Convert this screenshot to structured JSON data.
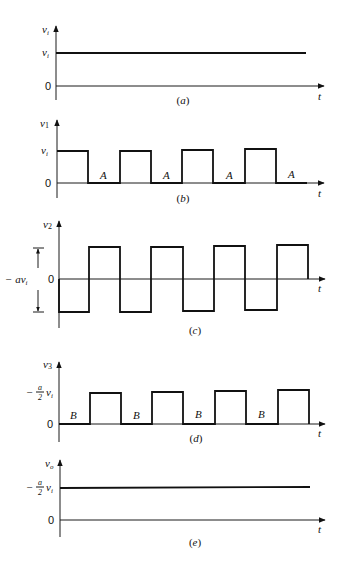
{
  "figure": {
    "panels": [
      {
        "id": "a",
        "caption": "(a)",
        "caption_letter": "a",
        "y_axis_label": "v",
        "y_axis_sub": "i",
        "x_axis_label": "t",
        "level_label_main": "v",
        "level_label_sub": "i",
        "zero_label": "0",
        "waveform": "constant"
      },
      {
        "id": "b",
        "caption": "(b)",
        "caption_letter": "b",
        "y_axis_label": "v",
        "y_axis_sub": "1",
        "x_axis_label": "t",
        "level_label_main": "v",
        "level_label_sub": "i",
        "zero_label": "0",
        "region_label": "A",
        "waveform": "square 0..v_i, starts high"
      },
      {
        "id": "c",
        "caption": "(c)",
        "caption_letter": "c",
        "y_axis_label": "v",
        "y_axis_sub": "2",
        "x_axis_label": "t",
        "amplitude_label_prefix": "− a",
        "amplitude_label_main": "v",
        "amplitude_label_sub": "i",
        "zero_label": "0",
        "waveform": "bipolar square, starts low"
      },
      {
        "id": "d",
        "caption": "(d)",
        "caption_letter": "d",
        "y_axis_label": "v",
        "y_axis_sub": "3",
        "x_axis_label": "t",
        "level_label_minus": "−",
        "level_label_num": "a",
        "level_label_den": "2",
        "level_label_main": "v",
        "level_label_sub": "i",
        "zero_label": "0",
        "region_label": "B",
        "waveform": "square 0..(-a/2)v_i, starts low"
      },
      {
        "id": "e",
        "caption": "(e)",
        "caption_letter": "e",
        "y_axis_label": "v",
        "y_axis_sub": "o",
        "x_axis_label": "t",
        "level_label_minus": "−",
        "level_label_num": "a",
        "level_label_den": "2",
        "level_label_main": "v",
        "level_label_sub": "i",
        "zero_label": "0",
        "waveform": "constant"
      }
    ]
  },
  "colors": {
    "ink": "#111111",
    "background": "#ffffff"
  }
}
